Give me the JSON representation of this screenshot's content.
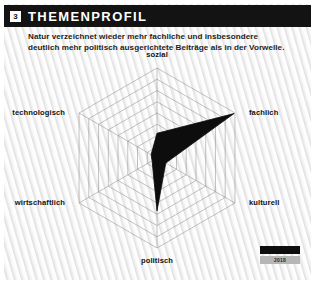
{
  "header": {
    "badge_number": "3",
    "title": "THEMENPROFIL"
  },
  "intro": {
    "text": "Natur verzeichnet wieder mehr fachliche und insbesondere deutlich mehr politisch ausgerichtete Beiträge als in der Vorwelle."
  },
  "legend": {
    "current_label": "",
    "previous_label": "2018",
    "current_color": "#0d0d0d",
    "previous_color": "#b6b6b6"
  },
  "chart_data": {
    "type": "radar",
    "title": "THEMENPROFIL",
    "categories": [
      "sozial",
      "fachlich",
      "kulturell",
      "politisch",
      "wirtschaftlich",
      "technologisch"
    ],
    "rings": 8,
    "rmax": 8,
    "grid": true,
    "legend_position": "bottom-right",
    "series": [
      {
        "name": "aktuell",
        "color": "#0d0d0d",
        "values": [
          2.2,
          7.9,
          0.9,
          4.7,
          0.5,
          0.6
        ]
      },
      {
        "name": "2018",
        "color": "#b6b6b6",
        "values": [
          2.1,
          7.2,
          0.8,
          4.2,
          0.5,
          0.6
        ]
      }
    ],
    "xlabel": "",
    "ylabel": ""
  }
}
